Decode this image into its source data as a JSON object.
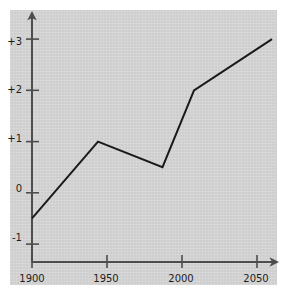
{
  "chart_data": {
    "type": "line",
    "title": "",
    "subtitle": "",
    "xlabel": "",
    "ylabel": "",
    "xlim": [
      1900,
      2060
    ],
    "ylim": [
      -1.35,
      3.45
    ],
    "grid": false,
    "legend": null,
    "xticks": [
      1900,
      1950,
      2000,
      2050
    ],
    "xtick_labels": [
      "1900",
      "1950",
      "2000",
      "2050"
    ],
    "yticks": [
      -1,
      0,
      1,
      2,
      3
    ],
    "ytick_labels": [
      "-1",
      "0",
      "+1",
      "+2",
      "+3"
    ],
    "series": [
      {
        "name": "series-1",
        "color": "#1a1a1a",
        "x": [
          1900,
          1944,
          1987,
          2008,
          2060
        ],
        "values": [
          -0.5,
          1.0,
          0.5,
          2.0,
          3.0
        ]
      }
    ],
    "axis_style": {
      "x_axis_arrow": true,
      "y_axis_arrow": true,
      "axis_color": "#4d4d4d",
      "tick_color": "#4d4d4d"
    },
    "colors": {
      "panel_background": "#d2d2d2",
      "page_background": "#ffffff",
      "line": "#1a1a1a",
      "text": "#1d1d1d"
    }
  }
}
